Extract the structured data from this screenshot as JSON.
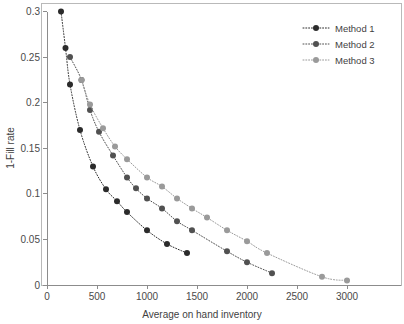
{
  "chart_data": {
    "type": "scatter",
    "title": "",
    "xlabel": "Average on hand inventory",
    "ylabel": "1-Fill rate",
    "xlim": [
      0,
      3100
    ],
    "ylim": [
      0,
      0.3
    ],
    "xticks": [
      0,
      500,
      1000,
      1500,
      2000,
      2500,
      3000
    ],
    "xtick_labels": [
      "0",
      "500",
      "1000",
      "1500",
      "2000",
      "2500",
      "3000"
    ],
    "yticks": [
      0,
      0.05,
      0.1,
      0.15,
      0.2,
      0.25,
      0.3
    ],
    "ytick_labels": [
      "0",
      "0.05",
      "0.1",
      "0.15",
      "0.2",
      "0.25",
      "0.3"
    ],
    "grid": false,
    "legend_position": "top-right",
    "marker": "circle",
    "linestyle": "dotted",
    "series": [
      {
        "name": "Method 1",
        "color": "#2b2b2b",
        "x": [
          140,
          185,
          230,
          330,
          460,
          590,
          700,
          800,
          1000,
          1200,
          1400
        ],
        "y": [
          0.3,
          0.26,
          0.22,
          0.17,
          0.13,
          0.105,
          0.092,
          0.08,
          0.06,
          0.045,
          0.035
        ]
      },
      {
        "name": "Method 2",
        "color": "#515151",
        "x": [
          230,
          345,
          430,
          520,
          660,
          800,
          890,
          1000,
          1150,
          1300,
          1450,
          1800,
          2000,
          2250
        ],
        "y": [
          0.25,
          0.225,
          0.192,
          0.168,
          0.142,
          0.118,
          0.106,
          0.095,
          0.084,
          0.07,
          0.06,
          0.037,
          0.025,
          0.013
        ]
      },
      {
        "name": "Method 3",
        "color": "#9a9a9a",
        "x": [
          345,
          430,
          560,
          680,
          800,
          1000,
          1150,
          1300,
          1450,
          1600,
          1800,
          2000,
          2200,
          2750,
          3000
        ],
        "y": [
          0.225,
          0.198,
          0.172,
          0.152,
          0.138,
          0.118,
          0.108,
          0.095,
          0.084,
          0.074,
          0.06,
          0.048,
          0.035,
          0.009,
          0.005
        ]
      }
    ]
  },
  "legend": {
    "entries": [
      {
        "label": "Method 1"
      },
      {
        "label": "Method 2"
      },
      {
        "label": "Method 3"
      }
    ]
  },
  "axes": {
    "x_title": "Average on hand inventory",
    "y_title": "1-Fill rate"
  }
}
